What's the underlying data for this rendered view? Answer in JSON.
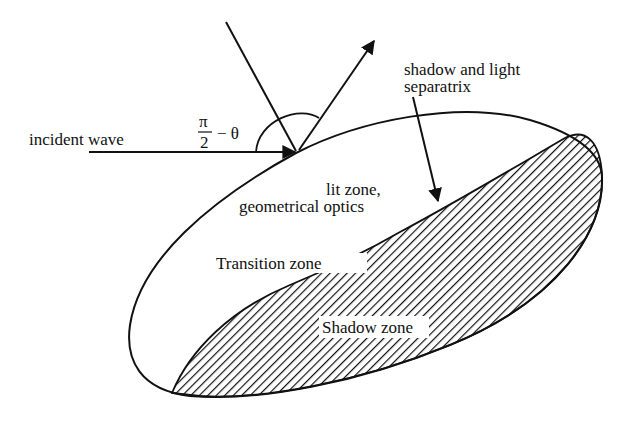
{
  "diagram": {
    "labels": {
      "incident_wave": "incident wave",
      "angle_numerator": "π",
      "angle_denominator": "2",
      "angle_suffix": "− θ",
      "separatrix_line1": "shadow and light",
      "separatrix_line2": "separatrix",
      "lit_zone_line1": "lit zone,",
      "lit_zone_line2": "geometrical optics",
      "transition_zone": "Transition zone",
      "shadow_zone": "Shadow zone"
    },
    "elements": [
      "incident-wave-arrow",
      "normal-line",
      "reflected-wave-arrow",
      "angle-arc",
      "ellipsoid-body-outline",
      "shadow-zone-hatched-region",
      "separatrix-pointer-arrow"
    ],
    "colors": {
      "ink": "#111111",
      "background": "#ffffff"
    }
  }
}
